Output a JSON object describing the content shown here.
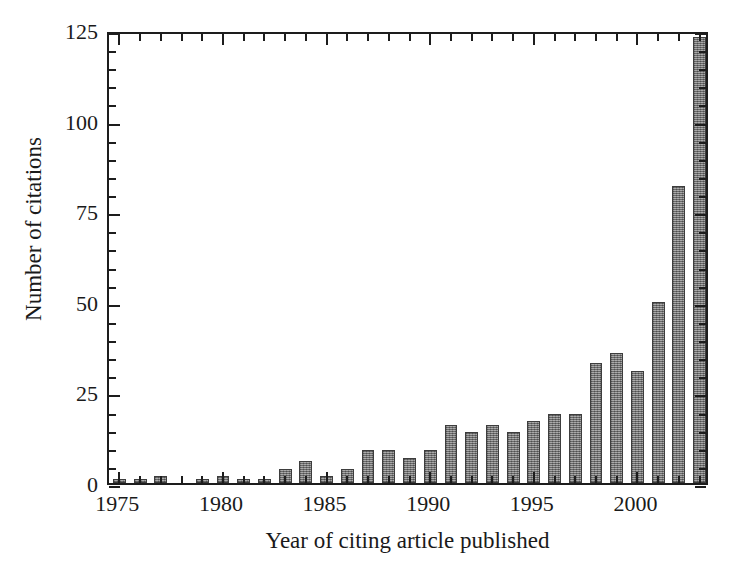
{
  "chart_data": {
    "type": "bar",
    "title": "",
    "xlabel": "Year of citing article published",
    "ylabel": "Number of citations",
    "xlim": [
      1974.5,
      2003.5
    ],
    "ylim": [
      0,
      125
    ],
    "grid": false,
    "legend": null,
    "y_major_ticks": [
      0,
      25,
      50,
      75,
      100,
      125
    ],
    "y_minor_tick_step": 5,
    "y_tick_labels": [
      "0",
      "25",
      "50",
      "75",
      "100",
      "125"
    ],
    "x_major_ticks": [
      1975,
      1980,
      1985,
      1990,
      1995,
      2000
    ],
    "x_tick_labels": [
      "1975",
      "1980",
      "1985",
      "1990",
      "1995",
      "2000"
    ],
    "x_minor_tick_step": 1,
    "bar_color": "#8c8c8c",
    "bar_edge_color": "#3d3d3d",
    "categories": [
      1975,
      1976,
      1977,
      1978,
      1979,
      1980,
      1981,
      1982,
      1983,
      1984,
      1985,
      1986,
      1987,
      1988,
      1989,
      1990,
      1991,
      1992,
      1993,
      1994,
      1995,
      1996,
      1997,
      1998,
      1999,
      2000,
      2001,
      2002,
      2003
    ],
    "values": [
      1,
      1,
      2,
      0,
      1,
      2,
      1,
      1,
      4,
      6,
      2,
      4,
      9,
      9,
      7,
      9,
      16,
      14,
      16,
      14,
      17,
      19,
      19,
      33,
      36,
      31,
      50,
      82,
      123
    ]
  },
  "axis_titles": {
    "x": "Year of citing article published",
    "y": "Number of citations"
  }
}
